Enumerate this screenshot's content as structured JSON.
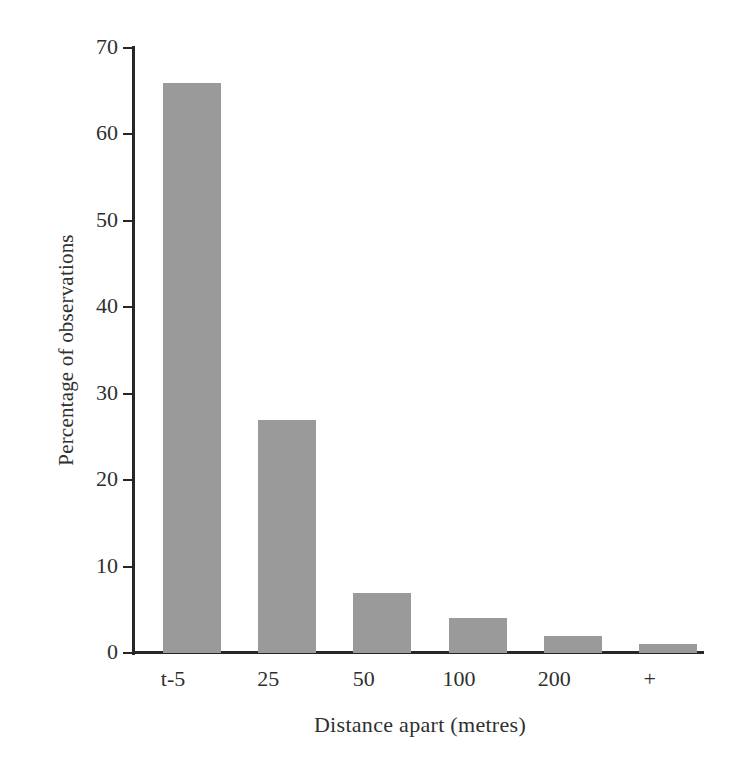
{
  "chart_data": {
    "type": "bar",
    "title": "",
    "subtitle": "",
    "xlabel": "Distance apart (metres)",
    "ylabel": "Percentage of observations",
    "categories": [
      "t-5",
      "25",
      "50",
      "100",
      "200",
      "+"
    ],
    "values": [
      66,
      27,
      7,
      4,
      2,
      1
    ],
    "series": [
      {
        "name": "Percentage of observations",
        "values": [
          66,
          27,
          7,
          4,
          2,
          1
        ]
      }
    ],
    "ylim": [
      0,
      70
    ],
    "y_ticks": [
      0,
      10,
      20,
      30,
      40,
      50,
      60,
      70
    ],
    "y_tick_labels": [
      "0",
      "10",
      "20",
      "30",
      "40",
      "50",
      "60",
      "70"
    ],
    "x_tick_labels": [
      "t-5",
      "25",
      "50",
      "100",
      "200",
      "+"
    ],
    "grid": false,
    "legend": false,
    "legend_position": "none",
    "annotations": [],
    "bar_color": "#9a9a9a",
    "axis_color": "#262626",
    "text_color": "#2f2f2f",
    "background_color": "#ffffff"
  }
}
